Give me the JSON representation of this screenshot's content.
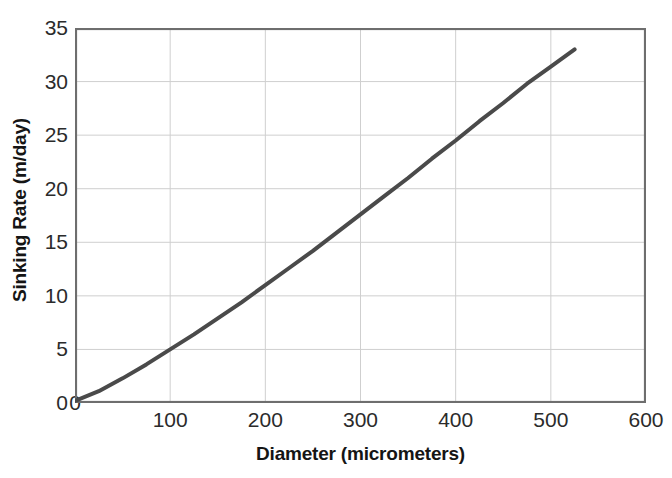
{
  "chart_data": {
    "type": "line",
    "title": "",
    "xlabel": "Diameter (micrometers)",
    "ylabel": "Sinking Rate (m/day)",
    "xlim": [
      0,
      600
    ],
    "ylim": [
      0,
      35
    ],
    "xticks": [
      0,
      100,
      200,
      300,
      400,
      500,
      600
    ],
    "xtick_labels": [
      "0",
      "100",
      "200",
      "300",
      "400",
      "500",
      "600"
    ],
    "yticks": [
      0,
      5,
      10,
      15,
      20,
      25,
      30,
      35
    ],
    "ytick_labels": [
      "0",
      "5",
      "10",
      "15",
      "20",
      "25",
      "30",
      "35"
    ],
    "grid": "both",
    "legend": "none",
    "series": [
      {
        "name": "Sinking rate vs diameter",
        "color": "#4a4a4a",
        "line_width": 4,
        "x": [
          0,
          25,
          50,
          75,
          100,
          125,
          150,
          175,
          200,
          225,
          250,
          275,
          300,
          325,
          350,
          375,
          400,
          425,
          450,
          475,
          500,
          525
        ],
        "y": [
          0.2,
          1.1,
          2.3,
          3.6,
          5.0,
          6.4,
          7.9,
          9.4,
          11.0,
          12.6,
          14.2,
          15.9,
          17.6,
          19.3,
          21.0,
          22.8,
          24.5,
          26.3,
          28.0,
          29.8,
          31.4,
          33.0
        ]
      }
    ],
    "annotations": []
  },
  "style": {
    "line_color": "#4a4a4a",
    "grid_color": "#cfcfcf",
    "axis_color": "#6e6e6e",
    "text_color": "#151515",
    "tick_text_color": "#2b2b2b",
    "background": "#ffffff"
  },
  "axes": {
    "y_title": "Sinking Rate (m/day)",
    "x_title": "Diameter (micrometers)"
  }
}
